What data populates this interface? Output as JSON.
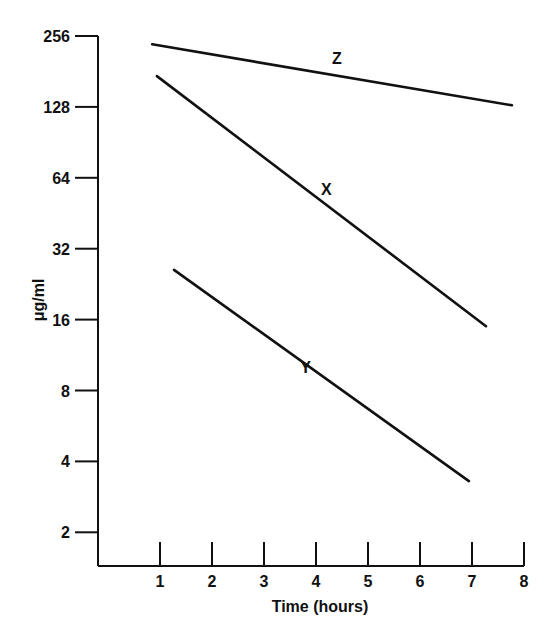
{
  "chart_data": {
    "type": "line",
    "title": "",
    "xlabel": "Time (hours)",
    "ylabel": "μg/ml",
    "yscale": "log2",
    "xlim": [
      0,
      8
    ],
    "ylim": [
      2,
      256
    ],
    "grid": false,
    "legend": "none (inline series labels)",
    "x_ticks": [
      "1",
      "2",
      "3",
      "4",
      "5",
      "6",
      "7",
      "8"
    ],
    "y_ticks": [
      "256",
      "128",
      "64",
      "32",
      "16",
      "8",
      "4",
      "2"
    ],
    "series": [
      {
        "name": "Z",
        "x": [
          0.85,
          7.77
        ],
        "values": [
          236,
          130
        ],
        "label_pos": {
          "x": 4.4,
          "y": 195
        }
      },
      {
        "name": "X",
        "x": [
          0.94,
          7.27
        ],
        "values": [
          173,
          15
        ],
        "label_pos": {
          "x": 4.2,
          "y": 54
        }
      },
      {
        "name": "Y",
        "x": [
          1.27,
          6.94
        ],
        "values": [
          26,
          3.3
        ],
        "label_pos": {
          "x": 3.8,
          "y": 9.5
        }
      }
    ],
    "color": "#111111"
  }
}
